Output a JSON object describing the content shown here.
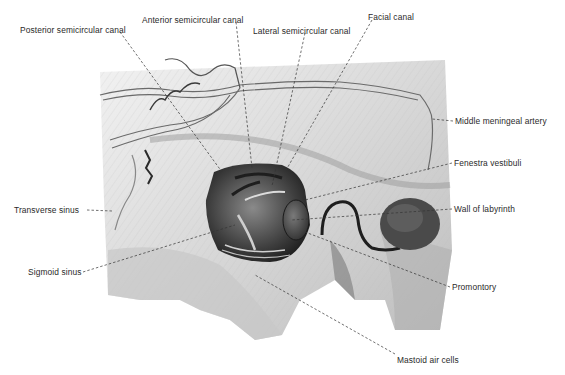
{
  "figure": {
    "colors": {
      "background": "#ffffff",
      "ink": "#2a2a2a",
      "bone": "#d9d9d9",
      "shadow": "#5a5a5a"
    }
  },
  "labels": [
    {
      "id": "posterior-semicircular-canal",
      "text": "Posterior semicircular canal",
      "x": 20,
      "y": 25,
      "target": [
        222,
        172
      ]
    },
    {
      "id": "anterior-semicircular-canal",
      "text": "Anterior semicircular canal",
      "x": 142,
      "y": 15,
      "target": [
        252,
        168
      ]
    },
    {
      "id": "lateral-semicircular-canal",
      "text": "Lateral semicircular canal",
      "x": 253,
      "y": 26,
      "target": [
        272,
        186
      ]
    },
    {
      "id": "facial-canal",
      "text": "Facial canal",
      "x": 368,
      "y": 13,
      "target": [
        285,
        172
      ]
    },
    {
      "id": "middle-meningeal-artery",
      "text": "Middle meningeal artery",
      "x": 455,
      "y": 117,
      "target": [
        432,
        119
      ]
    },
    {
      "id": "fenestra-vestibuli",
      "text": "Fenestra vestibuli",
      "x": 454,
      "y": 159,
      "target": [
        305,
        200
      ]
    },
    {
      "id": "wall-of-labyrinth",
      "text": "Wall of labyrinth",
      "x": 454,
      "y": 205,
      "target": [
        292,
        220
      ]
    },
    {
      "id": "transverse-sinus",
      "text": "Transverse sinus",
      "x": 14,
      "y": 206,
      "target": [
        112,
        211
      ]
    },
    {
      "id": "sigmoid-sinus",
      "text": "Sigmoid sinus",
      "x": 28,
      "y": 268,
      "target": [
        235,
        225
      ]
    },
    {
      "id": "promontory",
      "text": "Promontory",
      "x": 452,
      "y": 283,
      "target": [
        305,
        232
      ]
    },
    {
      "id": "mastoid-air-cells",
      "text": "Mastoid air cells",
      "x": 397,
      "y": 356,
      "target": [
        255,
        275
      ]
    }
  ]
}
